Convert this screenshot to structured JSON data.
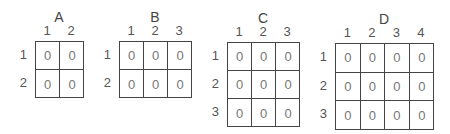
{
  "matrices": [
    {
      "name": "A",
      "rows": 2,
      "cols": 2,
      "col_labels": [
        "1",
        "2"
      ],
      "row_labels": [
        "1",
        "2"
      ],
      "values": [
        [
          "0",
          "0"
        ],
        [
          "0",
          "0"
        ]
      ],
      "geom": {
        "left": 35,
        "top": 41,
        "cw": 24,
        "ch": 28
      }
    },
    {
      "name": "B",
      "rows": 2,
      "cols": 3,
      "col_labels": [
        "1",
        "2",
        "3"
      ],
      "row_labels": [
        "1",
        "2"
      ],
      "values": [
        [
          "0",
          "0",
          "0"
        ],
        [
          "0",
          "0",
          "0"
        ]
      ],
      "geom": {
        "left": 119,
        "top": 41,
        "cw": 24,
        "ch": 28
      }
    },
    {
      "name": "C",
      "rows": 3,
      "cols": 3,
      "col_labels": [
        "1",
        "2",
        "3"
      ],
      "row_labels": [
        "1",
        "2",
        "3"
      ],
      "values": [
        [
          "0",
          "0",
          "0"
        ],
        [
          "0",
          "0",
          "0"
        ],
        [
          "0",
          "0",
          "0"
        ]
      ],
      "geom": {
        "left": 227,
        "top": 42,
        "cw": 24,
        "ch": 28
      }
    },
    {
      "name": "D",
      "rows": 3,
      "cols": 4,
      "col_labels": [
        "1",
        "2",
        "3",
        "4"
      ],
      "row_labels": [
        "1",
        "2",
        "3"
      ],
      "values": [
        [
          "0",
          "0",
          "0",
          "0"
        ],
        [
          "0",
          "0",
          "0",
          "0"
        ],
        [
          "0",
          "0",
          "0",
          "0"
        ]
      ],
      "geom": {
        "left": 335,
        "top": 43,
        "cw": 24.5,
        "ch": 28.5
      }
    }
  ]
}
